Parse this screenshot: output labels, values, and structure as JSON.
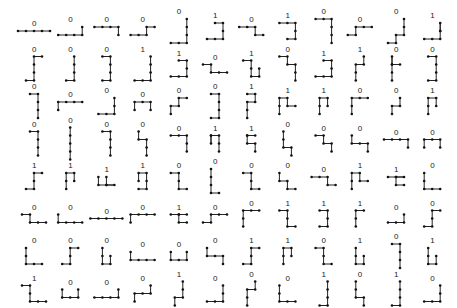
{
  "layout": {
    "rows": 8,
    "cols": 12,
    "origin_x": 20,
    "origin_y": 10,
    "col_step": 36.2,
    "row_step": 37.5,
    "unit": 8
  },
  "style": {
    "line_color": "#222222",
    "dot_color": "#111111",
    "label_color": "#222222"
  },
  "rows": [
    {
      "cells": [
        {
          "label": "0",
          "path": "RRRR"
        },
        {
          "label": "0",
          "path": "RRRU"
        },
        {
          "label": "0",
          "path": "RRRD"
        },
        {
          "label": "0",
          "path": "RRUR"
        },
        {
          "label": "0",
          "path": "RRUUU"
        },
        {
          "label": "1",
          "path": "RRUUL"
        },
        {
          "label": "0",
          "path": "RRDR"
        },
        {
          "label": "1",
          "path": "RRDDL"
        },
        {
          "label": "0",
          "path": "RRDDD"
        },
        {
          "label": "0",
          "path": "RURR"
        },
        {
          "label": "0",
          "path": "RURUU"
        },
        {
          "label": "1",
          "path": "RRUUD"
        }
      ]
    },
    {
      "cells": [
        {
          "label": "0",
          "path": "RUUUR"
        },
        {
          "label": "0",
          "path": "RUUU"
        },
        {
          "label": "0",
          "path": "RUUUL"
        },
        {
          "label": "1",
          "path": "RRUUU"
        },
        {
          "label": "1",
          "path": "RRUUL"
        },
        {
          "label": "0",
          "path": "RDRR"
        },
        {
          "label": "1",
          "path": "RDDRU"
        },
        {
          "label": "0",
          "path": "RDRDD"
        },
        {
          "label": "1",
          "path": "RRUUL"
        },
        {
          "label": "1",
          "path": "UURU"
        },
        {
          "label": "0",
          "path": "UUUDR"
        },
        {
          "label": "0",
          "path": "RUUUL"
        }
      ]
    },
    {
      "cells": [
        {
          "label": "0",
          "path": "RDDD"
        },
        {
          "label": "0",
          "path": "URRR"
        },
        {
          "label": "0",
          "path": "RRUU"
        },
        {
          "label": "0",
          "path": "URRD"
        },
        {
          "label": "0",
          "path": "URUR"
        },
        {
          "label": "0",
          "path": "RUUUL"
        },
        {
          "label": "1",
          "path": "UURUL"
        },
        {
          "label": "1",
          "path": "UURDR"
        },
        {
          "label": "1",
          "path": "UURD"
        },
        {
          "label": "0",
          "path": "UURR"
        },
        {
          "label": "0",
          "path": "URU"
        },
        {
          "label": "1",
          "path": "UURD"
        }
      ]
    },
    {
      "cells": [
        {
          "label": "0",
          "path": "RDDD"
        },
        {
          "label": "0",
          "path": "DDDD"
        },
        {
          "label": "0",
          "path": "RDDD"
        },
        {
          "label": "0",
          "path": "DRDD"
        },
        {
          "label": "0",
          "path": "RRDD"
        },
        {
          "label": "1",
          "path": "DURDD"
        },
        {
          "label": "1",
          "path": "RLDRD"
        },
        {
          "label": "0",
          "path": "DDRD"
        },
        {
          "label": "0",
          "path": "RDRD"
        },
        {
          "label": "0",
          "path": "DRRD"
        },
        {
          "label": "0",
          "path": "RRRD"
        },
        {
          "label": "0",
          "path": "URRD"
        }
      ]
    },
    {
      "cells": [
        {
          "label": "1",
          "path": "RUUR"
        },
        {
          "label": "1",
          "path": "UURD"
        },
        {
          "label": "1",
          "path": "DRLLU"
        },
        {
          "label": "1",
          "path": "RUULD"
        },
        {
          "label": "0",
          "path": "RDDR"
        },
        {
          "label": "0",
          "path": "DDDR"
        },
        {
          "label": "0",
          "path": "RDDR"
        },
        {
          "label": "0",
          "path": "DRDR"
        },
        {
          "label": "0",
          "path": "RRDR"
        },
        {
          "label": "1",
          "path": "UURDR"
        },
        {
          "label": "1",
          "path": "RRLDR"
        },
        {
          "label": "0",
          "path": "DDRR"
        }
      ]
    },
    {
      "cells": [
        {
          "label": "0",
          "path": "RDRR"
        },
        {
          "label": "0",
          "path": "DRRR"
        },
        {
          "label": "0",
          "path": "RRRR"
        },
        {
          "label": "0",
          "path": "URRR"
        },
        {
          "label": "1",
          "path": "RRLDR"
        },
        {
          "label": "0",
          "path": "RURR"
        },
        {
          "label": "0",
          "path": "UURR"
        },
        {
          "label": "1",
          "path": "RDDR"
        },
        {
          "label": "1",
          "path": "RDDL"
        },
        {
          "label": "1",
          "path": "UUR"
        },
        {
          "label": "0",
          "path": "RRU"
        },
        {
          "label": "0",
          "path": "RUUR"
        }
      ]
    },
    {
      "cells": [
        {
          "label": "0",
          "path": "DDRR"
        },
        {
          "label": "0",
          "path": "RUUR"
        },
        {
          "label": "0",
          "path": "DDRU"
        },
        {
          "label": "0",
          "path": "DRRR"
        },
        {
          "label": "0",
          "path": "DRRU"
        },
        {
          "label": "0",
          "path": "DRRD"
        },
        {
          "label": "1",
          "path": "RUUR"
        },
        {
          "label": "1",
          "path": "UURD"
        },
        {
          "label": "0",
          "path": "RDDR"
        },
        {
          "label": "1",
          "path": "DDRU"
        },
        {
          "label": "0",
          "path": "RDDD"
        },
        {
          "label": "1",
          "path": "DDRU"
        }
      ]
    },
    {
      "cells": [
        {
          "label": "1",
          "path": "RDDRR"
        },
        {
          "label": "0",
          "path": "DRRU"
        },
        {
          "label": "0",
          "path": "RRRU"
        },
        {
          "label": "0",
          "path": "URRU"
        },
        {
          "label": "1",
          "path": "URUU"
        },
        {
          "label": "0",
          "path": "RRUU"
        },
        {
          "label": "0",
          "path": "UURU"
        },
        {
          "label": "0",
          "path": "DDRR"
        },
        {
          "label": "1",
          "path": "RUUU"
        },
        {
          "label": "0",
          "path": "DDRD"
        },
        {
          "label": "1",
          "path": "RUUU"
        },
        {
          "label": "0",
          "path": "RRUU"
        }
      ]
    }
  ]
}
